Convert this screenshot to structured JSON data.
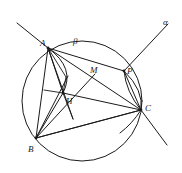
{
  "figure": {
    "width": 182,
    "height": 173,
    "background_color": "#ffffff",
    "stroke_color": "#1a1a1a"
  },
  "labels": [
    {
      "id": "A",
      "text": "A",
      "x": 40,
      "y": 39
    },
    {
      "id": "beta",
      "text": "β",
      "x": 73,
      "y": 37
    },
    {
      "id": "alpha",
      "text": "α",
      "x": 163,
      "y": 18
    },
    {
      "id": "P",
      "text": "P",
      "x": 127,
      "y": 67
    },
    {
      "id": "M",
      "text": "M",
      "x": 90,
      "y": 66
    },
    {
      "id": "C",
      "text": "C",
      "x": 145,
      "y": 104
    },
    {
      "id": "H",
      "text": "H",
      "x": 66,
      "y": 97
    },
    {
      "id": "B",
      "text": "B",
      "x": 28,
      "y": 145
    }
  ],
  "points": {
    "A": {
      "x": 48,
      "y": 48
    },
    "B": {
      "x": 36,
      "y": 138
    },
    "C": {
      "x": 141,
      "y": 110
    },
    "H": {
      "x": 63,
      "y": 93
    },
    "M": {
      "x": 95,
      "y": 74
    },
    "P": {
      "x": 124,
      "y": 71
    },
    "F": {
      "x": 66,
      "y": 77
    },
    "G": {
      "x": 44,
      "y": 90
    },
    "K": {
      "x": 73,
      "y": 119
    },
    "L": {
      "x": 68,
      "y": 76
    }
  },
  "circle": {
    "cx": 82,
    "cy": 101,
    "r": 60
  },
  "arcs": {
    "arc_A_to_H": "A to H bulging right",
    "arc_P_to_C": "P to C bulging right"
  },
  "lines": {
    "alpha_line": "through B and P extended to upper right",
    "beta_arc": "upper arc of main circle near A",
    "segments": [
      "AB",
      "AC",
      "AH",
      "AK",
      "BC",
      "BH",
      "BM",
      "BP",
      "BF",
      "CH",
      "CM",
      "GH",
      "HK",
      "AM"
    ]
  }
}
